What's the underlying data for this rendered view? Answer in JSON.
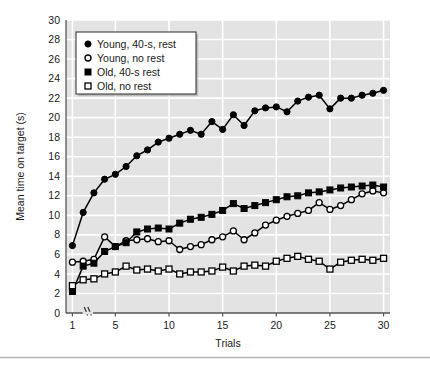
{
  "figure": {
    "background_color": "#ffffff",
    "plot_background_color": "#e3e3e3",
    "gridline_color": "#ffffff",
    "axis_color": "#555555",
    "series_color": "#000000",
    "legend_background_color": "#ffffff",
    "bottom_rule_color": "#b4b4b4"
  },
  "chart_data": {
    "type": "line",
    "title": "",
    "subtitle": "",
    "xlabel": "Trials",
    "ylabel": "Mean time on target (s)",
    "xlim": [
      0.4,
      30.6
    ],
    "ylim": [
      0,
      30
    ],
    "xticks": [
      1,
      5,
      10,
      15,
      20,
      25,
      30
    ],
    "xtick_labels": [
      "1",
      "5",
      "10",
      "15",
      "20",
      "25",
      "30"
    ],
    "yticks": [
      0,
      2,
      4,
      6,
      8,
      10,
      12,
      14,
      16,
      18,
      20,
      22,
      24,
      26,
      28,
      30
    ],
    "ytick_labels": [
      "0",
      "2",
      "4",
      "6",
      "8",
      "10",
      "12",
      "14",
      "16",
      "18",
      "20",
      "22",
      "24",
      "26",
      "28",
      "30"
    ],
    "grid": true,
    "grid_axis": "both",
    "legend_position": "upper left",
    "axis_break": {
      "present": true,
      "axis": "x",
      "between": [
        1,
        5
      ],
      "symbol": "//"
    },
    "x": [
      1,
      2,
      3,
      4,
      5,
      6,
      7,
      8,
      9,
      10,
      11,
      12,
      13,
      14,
      15,
      16,
      17,
      18,
      19,
      20,
      21,
      22,
      23,
      24,
      25,
      26,
      27,
      28,
      29,
      30
    ],
    "series": [
      {
        "name": "Young, 40-s, rest",
        "marker": "filled-circle",
        "color": "#000000",
        "values": [
          6.9,
          10.3,
          12.3,
          13.7,
          14.2,
          15.0,
          16.1,
          16.7,
          17.5,
          17.9,
          18.3,
          18.7,
          18.3,
          19.6,
          18.8,
          20.3,
          19.2,
          20.7,
          21.0,
          21.1,
          20.6,
          21.7,
          22.1,
          22.3,
          20.9,
          22.0,
          22.0,
          22.3,
          22.5,
          22.8
        ]
      },
      {
        "name": "Young, no rest",
        "marker": "open-circle",
        "color": "#000000",
        "values": [
          5.2,
          5.3,
          5.5,
          7.8,
          6.8,
          7.4,
          7.5,
          7.6,
          7.3,
          7.4,
          6.5,
          6.8,
          7.0,
          7.5,
          7.8,
          8.4,
          7.5,
          8.2,
          9.0,
          9.5,
          9.9,
          10.2,
          10.5,
          11.3,
          10.6,
          11.0,
          11.6,
          12.2,
          12.5,
          12.3
        ]
      },
      {
        "name": "Old, 40-s rest",
        "marker": "filled-square",
        "color": "#000000",
        "values": [
          2.2,
          4.8,
          5.1,
          6.3,
          6.8,
          7.2,
          8.3,
          8.6,
          8.7,
          8.6,
          9.2,
          9.6,
          9.8,
          10.1,
          10.5,
          11.2,
          10.7,
          11.0,
          11.3,
          11.6,
          11.9,
          12.0,
          12.3,
          12.4,
          12.6,
          12.8,
          12.9,
          13.0,
          13.1,
          12.9
        ]
      },
      {
        "name": "Old, no rest",
        "marker": "open-square",
        "color": "#000000",
        "values": [
          2.8,
          3.4,
          3.5,
          4.0,
          4.2,
          4.8,
          4.4,
          4.5,
          4.3,
          4.5,
          4.0,
          4.2,
          4.2,
          4.3,
          4.7,
          4.3,
          4.8,
          4.9,
          4.8,
          5.3,
          5.6,
          5.8,
          5.5,
          5.3,
          4.5,
          5.2,
          5.4,
          5.5,
          5.4,
          5.6
        ]
      }
    ]
  },
  "legend": {
    "items": [
      {
        "marker": "filled-circle",
        "label": "Young, 40-s, rest"
      },
      {
        "marker": "open-circle",
        "label": "Young, no rest"
      },
      {
        "marker": "filled-square",
        "label": "Old, 40-s rest"
      },
      {
        "marker": "open-square",
        "label": "Old, no rest"
      }
    ]
  }
}
